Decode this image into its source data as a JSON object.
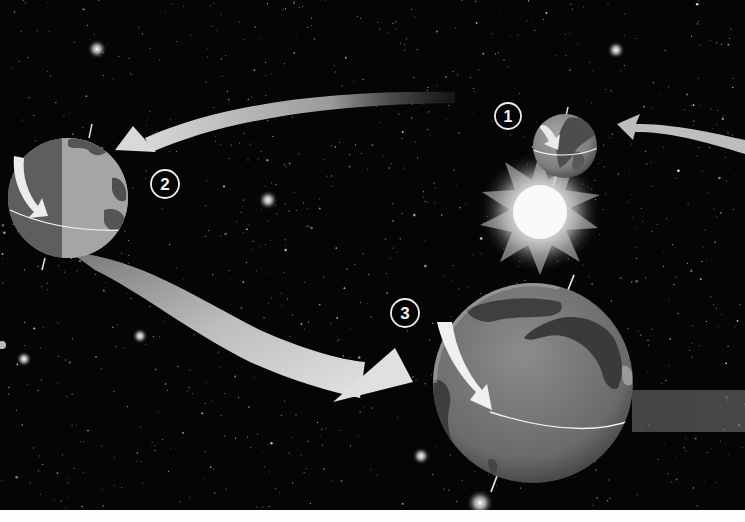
{
  "diagram": {
    "colors": {
      "space": "#050505",
      "arrow": "#c9c9c9",
      "earth_ocean": "#8a8a8a",
      "earth_land": "#4e4e4e",
      "sun_core": "#ffffff",
      "label_ring": "#eeeeee",
      "bottom_strip": "#fdfdfd"
    },
    "positions": [
      {
        "id": 1,
        "label": "1",
        "label_center": [
          508,
          116
        ],
        "earth_center": [
          565,
          146
        ],
        "earth_radius": 32
      },
      {
        "id": 2,
        "label": "2",
        "label_center": [
          165,
          184
        ],
        "earth_center": [
          68,
          198
        ],
        "earth_radius": 60
      },
      {
        "id": 3,
        "label": "3",
        "label_center": [
          405,
          313
        ],
        "earth_center": [
          533,
          383
        ],
        "earth_radius": 100
      }
    ],
    "sun": {
      "center": [
        540,
        212
      ],
      "radius": 30
    },
    "arrows": [
      {
        "name": "incoming-to-1",
        "from": "right edge",
        "to": "position 1"
      },
      {
        "name": "1-to-2",
        "from": "position 1",
        "to": "position 2"
      },
      {
        "name": "2-to-3",
        "from": "position 2",
        "to": "position 3"
      },
      {
        "name": "3-outgoing",
        "from": "position 3",
        "to": "right edge"
      }
    ]
  }
}
